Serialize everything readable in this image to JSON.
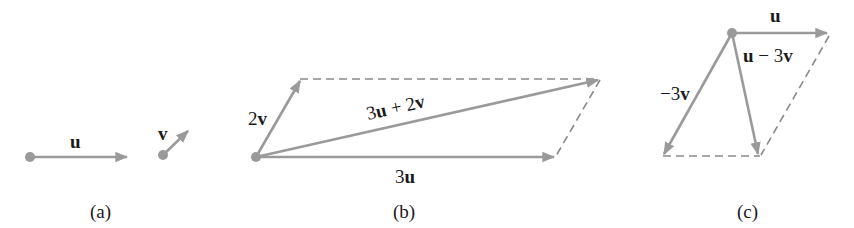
{
  "figure": {
    "panels": [
      {
        "caption": "(a)",
        "vectors": [
          {
            "name": "u",
            "label": "u"
          },
          {
            "name": "v",
            "label": "v"
          }
        ]
      },
      {
        "caption": "(b)",
        "vectors": [
          {
            "name": "2v",
            "label_num": "2",
            "label_var": "v"
          },
          {
            "name": "3u",
            "label_num": "3",
            "label_var": "u"
          },
          {
            "name": "3u+2v",
            "label": "3u + 2v",
            "parts": [
              "3",
              "u",
              " + 2",
              "v"
            ]
          }
        ]
      },
      {
        "caption": "(c)",
        "vectors": [
          {
            "name": "u",
            "label": "u"
          },
          {
            "name": "-3v",
            "label_num": "−3",
            "label_var": "v"
          },
          {
            "name": "u-3v",
            "parts": [
              "u",
              " − 3",
              "v"
            ]
          }
        ]
      }
    ],
    "colors": {
      "vector": "#9a9a9a",
      "dashed": "#8a8a8a",
      "text": "#1a1a1a"
    }
  }
}
